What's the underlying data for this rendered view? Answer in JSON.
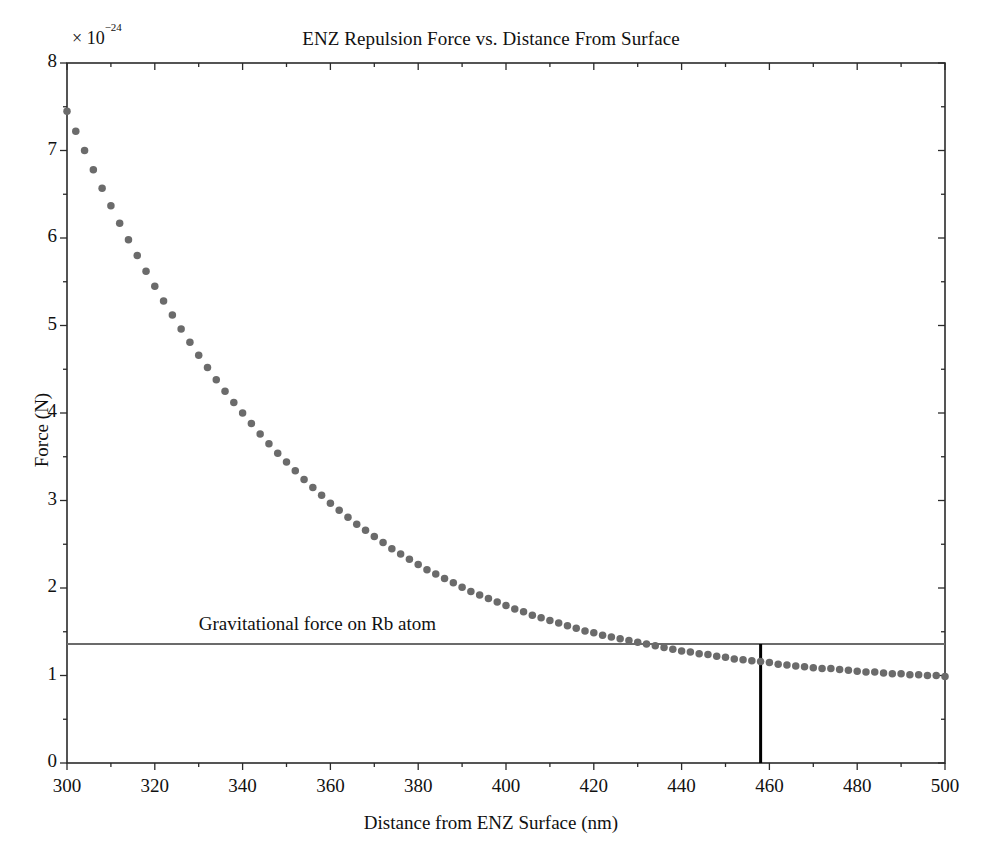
{
  "chart_data": {
    "type": "scatter",
    "title": "ENZ Repulsion Force vs. Distance From Surface",
    "xlabel": "Distance from ENZ Surface (nm)",
    "ylabel": "Force (N)",
    "y_exponent_label": "× 10",
    "y_exponent_value": "−24",
    "xlim": [
      300,
      500
    ],
    "ylim": [
      0,
      8
    ],
    "xticks": [
      300,
      320,
      340,
      360,
      380,
      400,
      420,
      440,
      460,
      480,
      500
    ],
    "xtick_labels": [
      "300",
      "320",
      "340",
      "360",
      "380",
      "400",
      "420",
      "440",
      "460",
      "480",
      "500"
    ],
    "yticks": [
      0,
      1,
      2,
      3,
      4,
      5,
      6,
      7,
      8
    ],
    "ytick_labels": [
      "0",
      "1",
      "2",
      "3",
      "4",
      "5",
      "6",
      "7",
      "8"
    ],
    "x_minor_tick_step": 10,
    "y_minor_tick_step": 0.5,
    "grid": false,
    "legend": null,
    "marker": {
      "shape": "circle",
      "size": 7.5,
      "color": "#6b6b6b"
    },
    "series": [
      {
        "name": "ENZ repulsion force",
        "x": [
          300,
          302,
          304,
          306,
          308,
          310,
          312,
          314,
          316,
          318,
          320,
          322,
          324,
          326,
          328,
          330,
          332,
          334,
          336,
          338,
          340,
          342,
          344,
          346,
          348,
          350,
          352,
          354,
          356,
          358,
          360,
          362,
          364,
          366,
          368,
          370,
          372,
          374,
          376,
          378,
          380,
          382,
          384,
          386,
          388,
          390,
          392,
          394,
          396,
          398,
          400,
          402,
          404,
          406,
          408,
          410,
          412,
          414,
          416,
          418,
          420,
          422,
          424,
          426,
          428,
          430,
          432,
          434,
          436,
          438,
          440,
          442,
          444,
          446,
          448,
          450,
          452,
          454,
          456,
          458,
          460,
          462,
          464,
          466,
          468,
          470,
          472,
          474,
          476,
          478,
          480,
          482,
          484,
          486,
          488,
          490,
          492,
          494,
          496,
          498,
          500
        ],
        "y": [
          7.45,
          7.22,
          7.0,
          6.78,
          6.57,
          6.37,
          6.17,
          5.98,
          5.8,
          5.62,
          5.45,
          5.28,
          5.12,
          4.96,
          4.81,
          4.66,
          4.52,
          4.38,
          4.25,
          4.12,
          4.0,
          3.88,
          3.76,
          3.65,
          3.54,
          3.44,
          3.34,
          3.24,
          3.15,
          3.06,
          2.97,
          2.89,
          2.81,
          2.73,
          2.66,
          2.59,
          2.52,
          2.45,
          2.39,
          2.33,
          2.27,
          2.21,
          2.16,
          2.11,
          2.06,
          2.01,
          1.96,
          1.92,
          1.88,
          1.84,
          1.8,
          1.76,
          1.73,
          1.69,
          1.66,
          1.63,
          1.6,
          1.57,
          1.54,
          1.51,
          1.49,
          1.46,
          1.44,
          1.42,
          1.4,
          1.38,
          1.36,
          1.34,
          1.32,
          1.3,
          1.28,
          1.27,
          1.25,
          1.24,
          1.22,
          1.21,
          1.19,
          1.18,
          1.17,
          1.16,
          1.15,
          1.13,
          1.12,
          1.11,
          1.1,
          1.09,
          1.08,
          1.08,
          1.07,
          1.06,
          1.05,
          1.04,
          1.04,
          1.03,
          1.02,
          1.02,
          1.01,
          1.01,
          1.0,
          1.0,
          0.99
        ]
      }
    ],
    "reference_lines": [
      {
        "name": "gravitational-force-line",
        "orientation": "horizontal",
        "value": 1.36,
        "label": "Gravitational force on Rb atom",
        "label_x": 330,
        "color": "#6b6b6b",
        "width": 2
      },
      {
        "name": "intersection-marker-line",
        "orientation": "vertical",
        "value": 458,
        "y_from": 0,
        "y_to": 1.36,
        "color": "#000000",
        "width": 3
      }
    ]
  }
}
